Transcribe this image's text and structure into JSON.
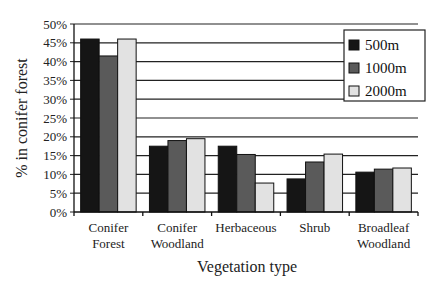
{
  "chart_data": {
    "type": "bar",
    "title": "",
    "xlabel": "Vegetation type",
    "ylabel": "% in conifer forest",
    "ylim": [
      0,
      50
    ],
    "yticks": [
      "0%",
      "5%",
      "10%",
      "15%",
      "20%",
      "25%",
      "30%",
      "35%",
      "40%",
      "45%",
      "50%"
    ],
    "grid": true,
    "legend_position": "top-right inside",
    "categories": [
      [
        "Conifer",
        "Forest"
      ],
      [
        "Conifer",
        "Woodland"
      ],
      [
        "Herbaceous"
      ],
      [
        "Shrub"
      ],
      [
        "Broadleaf",
        "Woodland"
      ]
    ],
    "series": [
      {
        "name": "500m",
        "color": "#151515",
        "values": [
          46,
          17.5,
          17.5,
          8.8,
          10.6
        ]
      },
      {
        "name": "1000m",
        "color": "#5a5a5a",
        "values": [
          41.5,
          19,
          15.3,
          13.3,
          11.4
        ]
      },
      {
        "name": "2000m",
        "color": "#e2e2e2",
        "values": [
          46,
          19.5,
          7.7,
          15.4,
          11.7
        ]
      }
    ]
  }
}
